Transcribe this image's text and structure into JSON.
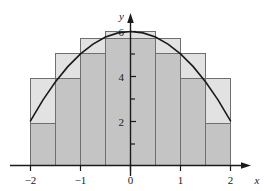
{
  "figure": {
    "kind": "riemann-sum-illustration",
    "background_color": "#ffffff"
  },
  "chart_data": {
    "type": "bar",
    "title": "",
    "subtitle": "",
    "xlabel": "x",
    "ylabel": "y",
    "xlim": [
      -2.35,
      2.35
    ],
    "ylim": [
      0,
      6.6
    ],
    "grid": false,
    "legend_position": "none",
    "function": {
      "expression": "6 - x^2",
      "label": "",
      "color": "#1a1a1a",
      "line_width": 1.6,
      "samples_x": [
        -2,
        -1.75,
        -1.5,
        -1.25,
        -1,
        -0.75,
        -0.5,
        -0.25,
        0,
        0.25,
        0.5,
        0.75,
        1,
        1.25,
        1.5,
        1.75,
        2
      ],
      "samples_y": [
        2,
        2.9375,
        3.75,
        4.4375,
        5,
        5.4375,
        5.75,
        5.9375,
        6,
        5.9375,
        5.75,
        5.4375,
        5,
        4.4375,
        3.75,
        2.9375,
        2
      ]
    },
    "bar_width": 0.5,
    "bar_edges": [
      -2,
      -1.5,
      -1,
      -0.5,
      0,
      0.5,
      1,
      1.5,
      2
    ],
    "categories": [
      "[-2,-1.5]",
      "[-1.5,-1]",
      "[-1,-0.5]",
      "[-0.5,0]",
      "[0,0.5]",
      "[0.5,1]",
      "[1,1.5]",
      "[1.5,2]"
    ],
    "series": [
      {
        "name": "upper-sum-rectangles",
        "fill_color": "#e2e2e2",
        "edge_color": "#6f6f6f",
        "values": [
          3.75,
          5,
          5.75,
          6,
          6,
          5.75,
          5,
          3.75
        ]
      },
      {
        "name": "lower-sum-rectangles",
        "fill_color": "#c4c4c4",
        "edge_color": "#6f6f6f",
        "values": [
          2,
          3.75,
          5,
          5.75,
          5.75,
          5,
          3.75,
          2
        ]
      }
    ],
    "x_ticks": [
      -2,
      -1,
      0,
      1,
      2
    ],
    "x_tick_labels": [
      "−2",
      "−1",
      "0",
      "1",
      "2"
    ],
    "y_ticks": [
      1,
      2,
      3,
      4,
      5,
      6
    ],
    "y_tick_labels": [
      "",
      "2",
      "",
      "4",
      "",
      "6"
    ],
    "y_labeled_ticks": [
      2,
      4,
      6
    ],
    "axis_color": "#1a1a1a",
    "axis_arrows": [
      "x-positive",
      "y-positive"
    ]
  },
  "axis_labels": {
    "x": "x",
    "y": "y"
  },
  "x_tick_text": {
    "t0": "−2",
    "t1": "−1",
    "t2": "0",
    "t3": "1",
    "t4": "2"
  },
  "y_tick_text": {
    "t2": "2",
    "t4": "4",
    "t6": "6"
  }
}
